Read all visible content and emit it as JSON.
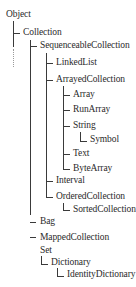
{
  "diagram": {
    "type": "class-hierarchy-tree",
    "root": "Object",
    "nodes": [
      {
        "id": "object",
        "label": "Object",
        "depth": 0
      },
      {
        "id": "collection",
        "label": "Collection",
        "depth": 1,
        "parent": "object"
      },
      {
        "id": "sequenceable",
        "label": "SequenceableCollection",
        "depth": 2,
        "parent": "collection"
      },
      {
        "id": "linkedlist",
        "label": "LinkedList",
        "depth": 3,
        "parent": "sequenceable"
      },
      {
        "id": "arrayed",
        "label": "ArrayedCollection",
        "depth": 3,
        "parent": "sequenceable"
      },
      {
        "id": "array",
        "label": "Array",
        "depth": 4,
        "parent": "arrayed"
      },
      {
        "id": "runarray",
        "label": "RunArray",
        "depth": 4,
        "parent": "arrayed"
      },
      {
        "id": "string",
        "label": "String",
        "depth": 4,
        "parent": "arrayed"
      },
      {
        "id": "symbol",
        "label": "Symbol",
        "depth": 5,
        "parent": "string"
      },
      {
        "id": "text",
        "label": "Text",
        "depth": 4,
        "parent": "arrayed"
      },
      {
        "id": "bytearray",
        "label": "ByteArray",
        "depth": 4,
        "parent": "arrayed"
      },
      {
        "id": "interval",
        "label": "Interval",
        "depth": 3,
        "parent": "sequenceable"
      },
      {
        "id": "ordered",
        "label": "OrderedCollection",
        "depth": 3,
        "parent": "sequenceable"
      },
      {
        "id": "sorted",
        "label": "SortedCollection",
        "depth": 4,
        "parent": "ordered"
      },
      {
        "id": "bag",
        "label": "Bag",
        "depth": 2,
        "parent": "collection"
      },
      {
        "id": "mapped",
        "label": "MappedCollection",
        "depth": 2,
        "parent": "collection"
      },
      {
        "id": "set",
        "label": "Set",
        "depth": 2,
        "parent": "collection"
      },
      {
        "id": "dictionary",
        "label": "Dictionary",
        "depth": 3,
        "parent": "set"
      },
      {
        "id": "identitydictionary",
        "label": "IdentityDictionary",
        "depth": 4,
        "parent": "dictionary"
      }
    ]
  }
}
